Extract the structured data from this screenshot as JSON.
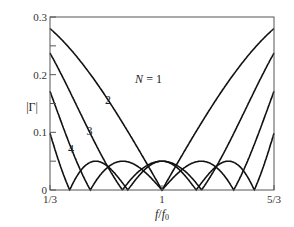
{
  "chart_data": {
    "type": "line",
    "title": "",
    "xlabel": "f/f0",
    "ylabel": "|Γ|",
    "xlim": [
      0.3333,
      1.6667
    ],
    "ylim": [
      0,
      0.3
    ],
    "x_ticks": [
      {
        "value": 0.3333,
        "label": "1/3"
      },
      {
        "value": 1,
        "label": "1"
      },
      {
        "value": 1.6667,
        "label": "5/3"
      }
    ],
    "y_ticks": [
      {
        "value": 0,
        "label": "0"
      },
      {
        "value": 0.1,
        "label": "0.1"
      },
      {
        "value": 0.2,
        "label": "0.2"
      },
      {
        "value": 0.3,
        "label": "0.3"
      }
    ],
    "y_minor_ticks": [
      0.05,
      0.15,
      0.25
    ],
    "grid": false,
    "legend": "inline labels",
    "model": {
      "gamma_load": 0.3333,
      "gamma_max_ripple": 0.05
    },
    "series": [
      {
        "name": "N = 1",
        "label": "N = 1",
        "N": 1,
        "start_value": 0.28,
        "zeros": [
          1.0
        ]
      },
      {
        "name": "N = 2",
        "label": "2",
        "N": 2,
        "start_value": 0.24,
        "ripple": 0.05
      },
      {
        "name": "N = 3",
        "label": "3",
        "N": 3,
        "start_value": 0.17,
        "ripple": 0.05
      },
      {
        "name": "N = 4",
        "label": "4",
        "N": 4,
        "start_value": 0.1,
        "ripple": 0.05
      }
    ],
    "annotations": [
      {
        "text": "N = 1",
        "x": 0.84,
        "y": 0.185
      },
      {
        "text": "2",
        "x": 0.66,
        "y": 0.15
      },
      {
        "text": "3",
        "x": 0.55,
        "y": 0.095
      },
      {
        "text": "4",
        "x": 0.44,
        "y": 0.065
      }
    ]
  }
}
